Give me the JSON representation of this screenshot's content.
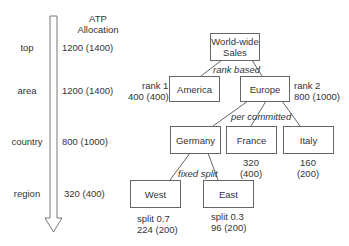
{
  "levels_axis": {
    "header": [
      "ATP",
      "Allocation"
    ],
    "levels": [
      {
        "name": "top",
        "allocation": "1200 (1400)"
      },
      {
        "name": "area",
        "allocation": "1200 (1400)"
      },
      {
        "name": "country",
        "allocation": "800 (1000)"
      },
      {
        "name": "region",
        "allocation": "320 (400)"
      }
    ],
    "arrow": "down-arrow"
  },
  "tree": {
    "root": {
      "label_line1": "World-wide",
      "label_line2": "Sales"
    },
    "edge_labels": {
      "rank": "rank based",
      "committed": "per committed",
      "split": "fixed split"
    },
    "america": {
      "label": "America",
      "note_line1": "rank 1",
      "note_line2": "400 (400)"
    },
    "europe": {
      "label": "Europe",
      "note_line1": "rank 2",
      "note_line2": "800 (1000)"
    },
    "germany": {
      "label": "Germany"
    },
    "france": {
      "label": "France",
      "note_line1": "320",
      "note_line2": "(400)"
    },
    "italy": {
      "label": "Italy",
      "note_line1": "160",
      "note_line2": "(200)"
    },
    "west": {
      "label": "West",
      "note_line1": "split 0.7",
      "note_line2": "224 (200)"
    },
    "east": {
      "label": "East",
      "note_line1": "split 0.3",
      "note_line2": "96 (200)"
    }
  },
  "colors": {
    "line": "#666666",
    "text": "#333333"
  }
}
